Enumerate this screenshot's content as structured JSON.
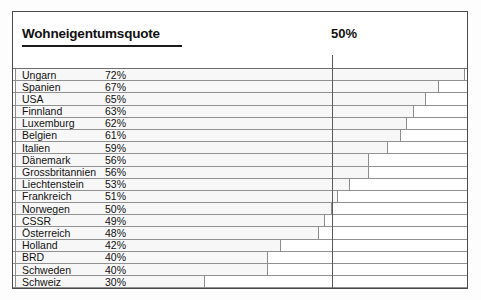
{
  "chart_data": {
    "type": "bar",
    "orientation": "horizontal",
    "title": "Wohneigentumsquote",
    "xlabel": "",
    "ylabel": "",
    "xlim": [
      0,
      72
    ],
    "grid": false,
    "legend": null,
    "reference_line": {
      "label": "50%",
      "value": 50
    },
    "value_suffix": "%",
    "categories": [
      "Ungarn",
      "Spanien",
      "USA",
      "Finnland",
      "Luxemburg",
      "Belgien",
      "Italien",
      "Dänemark",
      "Grossbritannien",
      "Liechtenstein",
      "Frankreich",
      "Norwegen",
      "CSSR",
      "Österreich",
      "Holland",
      "BRD",
      "Schweden",
      "Schweiz"
    ],
    "values": [
      72,
      67,
      65,
      63,
      62,
      61,
      59,
      56,
      56,
      53,
      51,
      50,
      49,
      48,
      42,
      40,
      40,
      30
    ],
    "value_labels": [
      "72%",
      "67%",
      "65%",
      "63%",
      "62%",
      "61%",
      "59%",
      "56%",
      "56%",
      "53%",
      "51%",
      "50%",
      "49%",
      "48%",
      "42%",
      "40%",
      "40%",
      "30%"
    ],
    "rows": [
      {
        "category": "Ungarn",
        "value": 72,
        "value_label": "72%"
      },
      {
        "category": "Spanien",
        "value": 67,
        "value_label": "67%"
      },
      {
        "category": "USA",
        "value": 65,
        "value_label": "65%"
      },
      {
        "category": "Finnland",
        "value": 63,
        "value_label": "63%"
      },
      {
        "category": "Luxemburg",
        "value": 62,
        "value_label": "62%"
      },
      {
        "category": "Belgien",
        "value": 61,
        "value_label": "61%"
      },
      {
        "category": "Italien",
        "value": 59,
        "value_label": "59%"
      },
      {
        "category": "Dänemark",
        "value": 56,
        "value_label": "56%"
      },
      {
        "category": "Grossbritannien",
        "value": 56,
        "value_label": "56%"
      },
      {
        "category": "Liechtenstein",
        "value": 53,
        "value_label": "53%"
      },
      {
        "category": "Frankreich",
        "value": 51,
        "value_label": "51%"
      },
      {
        "category": "Norwegen",
        "value": 50,
        "value_label": "50%"
      },
      {
        "category": "CSSR",
        "value": 49,
        "value_label": "49%"
      },
      {
        "category": "Österreich",
        "value": 48,
        "value_label": "48%"
      },
      {
        "category": "Holland",
        "value": 42,
        "value_label": "42%"
      },
      {
        "category": "BRD",
        "value": 40,
        "value_label": "40%"
      },
      {
        "category": "Schweden",
        "value": 40,
        "value_label": "40%"
      },
      {
        "category": "Schweiz",
        "value": 30,
        "value_label": "30%"
      }
    ],
    "colors": {
      "frame": "#4a4a4a",
      "bar_fill": "#f7f7f7",
      "bar_outline": "#8d8d8d",
      "rule": "#909090",
      "reference_line": "#5a5a5a",
      "text": "#111111",
      "background": "#ffffff"
    }
  }
}
